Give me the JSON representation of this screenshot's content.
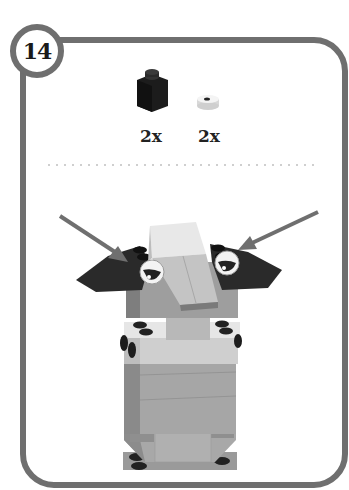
{
  "step": {
    "number": "14"
  },
  "parts_list": [
    {
      "name": "black 1x1 brick",
      "quantity": "2x",
      "color": "#1c1c1c"
    },
    {
      "name": "white round tile with eye print",
      "quantity": "2x",
      "color": "#f2f2f2"
    }
  ],
  "frame": {
    "border_color": "#6f6f6f"
  },
  "illustration": {
    "description": "Brick-built creature with dark angled ears and two eyes; arrows point to where ears attach",
    "arrows": 2
  }
}
